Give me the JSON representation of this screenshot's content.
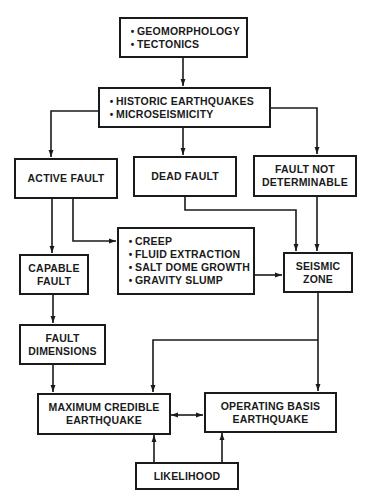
{
  "diagram": {
    "type": "flowchart",
    "colors": {
      "stroke": "#1a1a1a",
      "background": "#ffffff"
    },
    "nodes": {
      "inputs": {
        "lines": [
          "GEOMORPHOLOGY",
          "TECTONICS"
        ]
      },
      "seismicity": {
        "lines": [
          "HISTORIC EARTHQUAKES",
          "MICROSEISMICITY"
        ]
      },
      "active_fault": {
        "lines": [
          "ACTIVE FAULT"
        ]
      },
      "dead_fault": {
        "lines": [
          "DEAD FAULT"
        ]
      },
      "fault_not_determinable": {
        "lines": [
          "FAULT NOT",
          "DETERMINABLE"
        ]
      },
      "non_tectonic": {
        "lines": [
          "CREEP",
          "FLUID EXTRACTION",
          "SALT DOME GROWTH",
          "GRAVITY SLUMP"
        ]
      },
      "capable_fault": {
        "lines": [
          "CAPABLE",
          "FAULT"
        ]
      },
      "seismic_zone": {
        "lines": [
          "SEISMIC",
          "ZONE"
        ]
      },
      "fault_dimensions": {
        "lines": [
          "FAULT",
          "DIMENSIONS"
        ]
      },
      "mce": {
        "lines": [
          "MAXIMUM CREDIBLE",
          "EARTHQUAKE"
        ]
      },
      "obe": {
        "lines": [
          "OPERATING BASIS",
          "EARTHQUAKE"
        ]
      },
      "likelihood": {
        "lines": [
          "LIKELIHOOD"
        ]
      }
    },
    "edges": [
      {
        "from": "inputs",
        "to": "seismicity"
      },
      {
        "from": "seismicity",
        "to": "active_fault"
      },
      {
        "from": "seismicity",
        "to": "dead_fault"
      },
      {
        "from": "seismicity",
        "to": "fault_not_determinable"
      },
      {
        "from": "active_fault",
        "to": "capable_fault"
      },
      {
        "from": "active_fault",
        "to": "non_tectonic"
      },
      {
        "from": "dead_fault",
        "to": "seismic_zone"
      },
      {
        "from": "fault_not_determinable",
        "to": "seismic_zone"
      },
      {
        "from": "non_tectonic",
        "to": "seismic_zone"
      },
      {
        "from": "capable_fault",
        "to": "fault_dimensions"
      },
      {
        "from": "fault_dimensions",
        "to": "mce"
      },
      {
        "from": "seismic_zone",
        "to": "mce"
      },
      {
        "from": "seismic_zone",
        "to": "obe"
      },
      {
        "from": "mce",
        "to": "obe",
        "bidirectional": true
      },
      {
        "from": "likelihood",
        "to": "mce"
      },
      {
        "from": "likelihood",
        "to": "obe"
      }
    ]
  }
}
